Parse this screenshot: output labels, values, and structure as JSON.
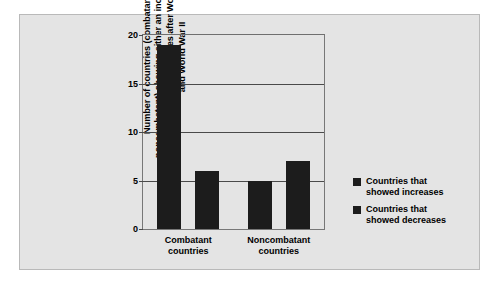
{
  "figure": {
    "background_color": "#e4e4e4",
    "border_color": "#b9b9b9",
    "bar_color": "#1c1c1c"
  },
  "chart_data": {
    "type": "bar",
    "title": "",
    "xlabel": "",
    "ylabel": "Number of countries (combatant vs. noncombatant) showing either an increase or a decrease in homicide rates after World War I and World War II",
    "categories": [
      "Combatant countries",
      "Noncombatant countries"
    ],
    "category_lines": [
      [
        "Combatant",
        "countries"
      ],
      [
        "Noncombatant",
        "countries"
      ]
    ],
    "series": [
      {
        "name": "Countries that showed increases",
        "values": [
          19,
          5
        ],
        "color": "#1c1c1c"
      },
      {
        "name": "Countries that showed decreases",
        "values": [
          6,
          7
        ],
        "color": "#1c1c1c"
      }
    ],
    "ylim": [
      0,
      20
    ],
    "yticks": [
      0,
      5,
      10,
      15,
      20
    ],
    "ytick_labels": [
      "0",
      "5",
      "10",
      "15",
      "20"
    ],
    "grid": true,
    "grid_axis": "y",
    "legend_position": "right"
  },
  "legend": {
    "entries": [
      {
        "label_line1": "Countries that",
        "label_line2": "showed increases"
      },
      {
        "label_line1": "Countries that",
        "label_line2": "showed decreases"
      }
    ]
  }
}
